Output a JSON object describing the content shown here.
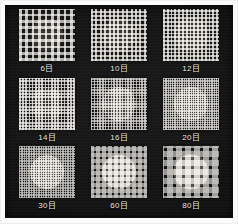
{
  "image": {
    "kind": "product-photo",
    "subject": "mesh screen samples",
    "background_color": "#101010",
    "border_color": "#fbfbfb",
    "label_color": "#e9e9e6",
    "disc_color": "#e8e5de",
    "wire_color": "#d8d5cd"
  },
  "samples": [
    {
      "label": "6目",
      "mesh_count": 6,
      "wire_pitch_px": 6.4,
      "wire_width_px": 2.6,
      "disc_diameter_px": 33,
      "brightness": 0.88
    },
    {
      "label": "10目",
      "mesh_count": 10,
      "wire_pitch_px": 4.4,
      "wire_width_px": 2.0,
      "disc_diameter_px": 33,
      "brightness": 0.88
    },
    {
      "label": "12目",
      "mesh_count": 12,
      "wire_pitch_px": 3.8,
      "wire_width_px": 1.8,
      "disc_diameter_px": 34,
      "brightness": 0.89
    },
    {
      "label": "14目",
      "mesh_count": 14,
      "wire_pitch_px": 3.2,
      "wire_width_px": 1.6,
      "disc_diameter_px": 33,
      "brightness": 0.9
    },
    {
      "label": "16目",
      "mesh_count": 16,
      "wire_pitch_px": 2.8,
      "wire_width_px": 1.5,
      "disc_diameter_px": 34,
      "brightness": 0.91
    },
    {
      "label": "20目",
      "mesh_count": 20,
      "wire_pitch_px": 2.3,
      "wire_width_px": 1.3,
      "disc_diameter_px": 34,
      "brightness": 0.92
    },
    {
      "label": "30目",
      "mesh_count": 30,
      "wire_pitch_px": 1.7,
      "wire_width_px": 1.0,
      "disc_diameter_px": 34,
      "brightness": 0.93
    },
    {
      "label": "60目",
      "mesh_count": 60,
      "wire_pitch_px": 1.2,
      "wire_width_px": 0.8,
      "disc_diameter_px": 34,
      "brightness": 0.94
    },
    {
      "label": "80目",
      "mesh_count": 80,
      "wire_pitch_px": 0.9,
      "wire_width_px": 0.6,
      "disc_diameter_px": 35,
      "brightness": 0.95
    }
  ]
}
